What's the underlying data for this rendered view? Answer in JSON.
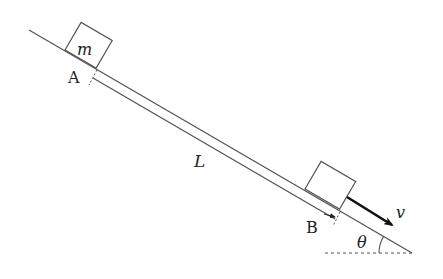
{
  "diagram": {
    "type": "physics-incline",
    "labels": {
      "mass": "m",
      "point_a": "A",
      "point_b": "B",
      "distance": "L",
      "velocity": "v",
      "angle": "θ"
    },
    "colors": {
      "line": "#555555",
      "arrow": "#111111",
      "text": "#222222",
      "background": "#ffffff"
    }
  }
}
